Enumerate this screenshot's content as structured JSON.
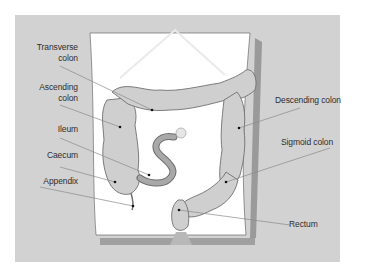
{
  "diagram": {
    "colors": {
      "panel": "#d2d2d2",
      "body": "#ffffff",
      "shadow": "#9a9a9a",
      "organ_fill": "#cfcfcf",
      "organ_stroke": "#6f6f6f",
      "ileum_fill": "#a8a8a8",
      "leader": "#8a8a8a",
      "text": "#2e2e2e"
    },
    "labels": {
      "transverse_colon_1": "Transverse",
      "transverse_colon_2": "colon",
      "ascending_colon_1": "Ascending",
      "ascending_colon_2": "colon",
      "ileum": "Ileum",
      "caecum": "Caecum",
      "appendix": "Appendix",
      "descending_colon": "Descending colon",
      "sigmoid_colon": "Sigmoid colon",
      "rectum": "Rectum"
    }
  }
}
